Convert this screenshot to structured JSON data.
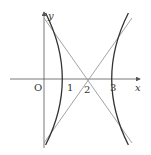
{
  "figure": {
    "axes": {
      "x_label": "x",
      "y_label": "y",
      "origin_label": "O",
      "x_ticks": [
        "1",
        "2",
        "3"
      ]
    },
    "curve": {
      "type": "hyperbola",
      "center": [
        2,
        0
      ],
      "vertices": [
        [
          1,
          0
        ],
        [
          3,
          0
        ]
      ],
      "equation": "(x-2)^2 - y^2/2 = 1"
    },
    "asymptotes": [
      {
        "passes_through": [
          2,
          0
        ],
        "slope": "sqrt(2)"
      },
      {
        "passes_through": [
          2,
          0
        ],
        "slope": "-sqrt(2)"
      }
    ],
    "colors": {
      "curve": "#333333",
      "asymptote": "#999999",
      "axis": "#555555"
    }
  }
}
